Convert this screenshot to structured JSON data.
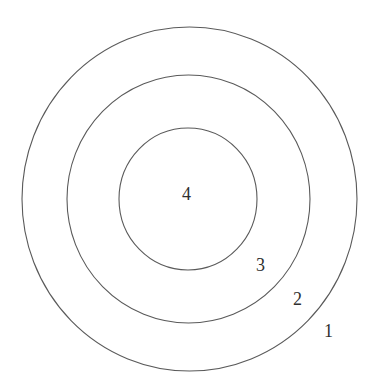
{
  "diagram": {
    "type": "concentric-circles",
    "stroke_color": "#5a5a5a",
    "text_color": "#2f2f2f",
    "rings": [
      {
        "id": "1",
        "label": "1",
        "cx": 189.5,
        "cy": 199,
        "rx": 167.5,
        "ry": 172,
        "label_x": 324,
        "label_y": 337
      },
      {
        "id": "2",
        "label": "2",
        "cx": 188.5,
        "cy": 199,
        "rx": 121.5,
        "ry": 124,
        "label_x": 293,
        "label_y": 305
      },
      {
        "id": "3",
        "label": "3",
        "cx": 188,
        "cy": 199,
        "rx": 69,
        "ry": 71,
        "label_x": 256,
        "label_y": 271
      },
      {
        "id": "4",
        "label": "4",
        "label_x": 182,
        "label_y": 200
      }
    ]
  }
}
